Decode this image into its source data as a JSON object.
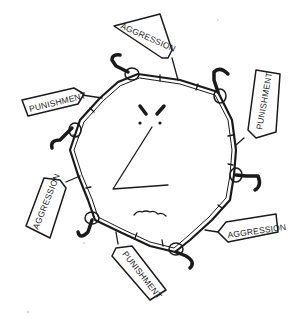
{
  "illustration": {
    "subject": "cartoon-angry-face-surrounded-by-barbed-wire-loop",
    "face": {
      "expression": "angry",
      "features": [
        "furrowed-eyebrows",
        "dot-eyes",
        "angular-nose",
        "wavy-frown"
      ]
    },
    "chain": {
      "description": "bamboo-like segmented wire with hands gripping candy-cane hooks"
    },
    "tags": [
      {
        "label": "AGGRESSION",
        "position": "top"
      },
      {
        "label": "PUNISHMENT",
        "position": "upper-left"
      },
      {
        "label": "PUNISHMENT",
        "position": "upper-right"
      },
      {
        "label": "AGGRESSION",
        "position": "lower-left"
      },
      {
        "label": "PUNISHMENT",
        "position": "bottom"
      },
      {
        "label": "AGGRESSION",
        "position": "lower-right"
      }
    ],
    "colors": {
      "ink": "#1a1a1a",
      "background": "#ffffff"
    }
  }
}
